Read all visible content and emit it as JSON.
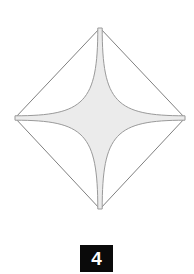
{
  "figure": {
    "caption_label": "4",
    "background_color": "#ffffff",
    "outline_color": "#808080",
    "star_edge_color": "#9a9a9a",
    "star_fill_color": "#ebebeb",
    "diamond": {
      "name": "diamond-outline",
      "top": [
        100,
        28
      ],
      "right": [
        185,
        118
      ],
      "bottom": [
        100,
        209
      ],
      "left": [
        15,
        118
      ],
      "stroke_width": 1
    },
    "star": {
      "name": "four-pointed-star",
      "center": [
        100,
        118
      ],
      "points": 4,
      "tip_top": [
        100,
        28
      ],
      "tip_right": [
        185,
        118
      ],
      "tip_bottom": [
        100,
        209
      ],
      "tip_left": [
        15,
        118
      ],
      "arm_half_width": 2.2,
      "core_radius": 15,
      "stroke_width": 1
    }
  },
  "caption": {
    "text": "4",
    "box_color": "#0a0a0a",
    "text_color": "#ffffff"
  }
}
